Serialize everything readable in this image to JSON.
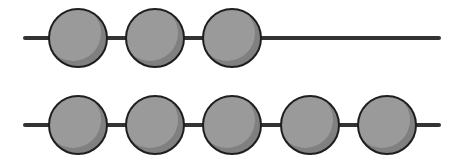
{
  "diagram": {
    "title": "",
    "rows": [
      {
        "name": "top-row",
        "line": {
          "x1": 25,
          "x2": 439,
          "y": 38
        },
        "bead_count": 3,
        "beads_cx": [
          78,
          155,
          232
        ]
      },
      {
        "name": "bottom-row",
        "line": {
          "x1": 25,
          "x2": 439,
          "y": 125
        },
        "bead_count": 5,
        "beads_cx": [
          78,
          155,
          232,
          310,
          387
        ]
      }
    ],
    "bead": {
      "radius": 29,
      "fill": "#9a9a9a",
      "shade": "#808080",
      "stroke": "#1e1e1e"
    },
    "line_color": "#333333"
  }
}
